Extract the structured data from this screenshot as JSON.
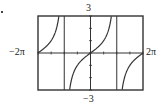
{
  "chart_data": {
    "type": "line",
    "title": "",
    "function": "tan(x/2)",
    "series": [
      {
        "name": "y = tan(x/2)",
        "x_range": [
          -6.2832,
          6.2832
        ],
        "asymptotes": [
          -3.1416,
          3.1416
        ]
      }
    ],
    "xlim": [
      -6.2832,
      6.2832
    ],
    "ylim": [
      -3,
      3
    ],
    "xlabel": "",
    "ylabel": "",
    "tick_labels": {
      "x_min": "−2π",
      "x_max": "2π",
      "y_max": "3",
      "y_min": "−3"
    },
    "x_tick_step": 1.5708,
    "y_tick_step": 1,
    "grid": false,
    "legend": null
  },
  "labels": {
    "y_max": "3",
    "y_min": "−3",
    "x_min": "−2π",
    "x_max": "2π"
  },
  "colors": {
    "frame": "#333333",
    "curve": "#333333",
    "axis": "#333333"
  }
}
